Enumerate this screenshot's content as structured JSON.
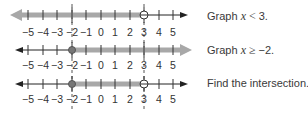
{
  "number_line": {
    "ticks": [
      -5,
      -4,
      -3,
      -2,
      -1,
      0,
      1,
      2,
      3,
      4,
      5
    ],
    "tick_labels": [
      "−5",
      "−4",
      "−3",
      "−2",
      "−1",
      "0",
      "1",
      "2",
      "3",
      "4",
      "5"
    ],
    "critical_points": [
      -2,
      3
    ]
  },
  "rows": [
    {
      "caption_prefix": "Graph ",
      "variable": "x",
      "relation": " < ",
      "value": "3.",
      "shading": "left of 3",
      "open_point": 3,
      "closed_point": null
    },
    {
      "caption_prefix": "Graph ",
      "variable": "x",
      "relation": " ≥ ",
      "value": "−2.",
      "shading": "right of -2",
      "open_point": null,
      "closed_point": -2
    },
    {
      "caption": "Find the intersection.",
      "shading": "between -2 and 3",
      "open_point": 3,
      "closed_point": -2
    }
  ],
  "colors": {
    "axis": "#222222",
    "shade": "#a8a8a8",
    "dashed": "#555555",
    "text": "#3a3a3a"
  }
}
